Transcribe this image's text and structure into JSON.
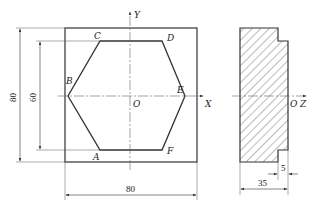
{
  "front_view": {
    "outer_square": {
      "x": 65,
      "y": 28,
      "w": 132,
      "h": 134
    },
    "hexagon_points": {
      "C": [
        100,
        41
      ],
      "D": [
        162,
        41
      ],
      "E": [
        185,
        96
      ],
      "F": [
        162,
        150
      ],
      "A": [
        100,
        150
      ],
      "B": [
        68,
        96
      ]
    },
    "labels": {
      "A": "A",
      "B": "B",
      "C": "C",
      "D": "D",
      "E": "E",
      "F": "F",
      "O": "O",
      "X": "X",
      "Y": "Y"
    },
    "dimensions": {
      "outer_height": "80",
      "inner_height": "60",
      "outer_width": "80"
    }
  },
  "side_view": {
    "labels": {
      "O": "O",
      "Z": "Z"
    },
    "dimensions": {
      "step": "5",
      "thickness": "35"
    }
  },
  "colors": {
    "line": "#333333",
    "hatch": "#555555",
    "center_line": "#666666"
  }
}
